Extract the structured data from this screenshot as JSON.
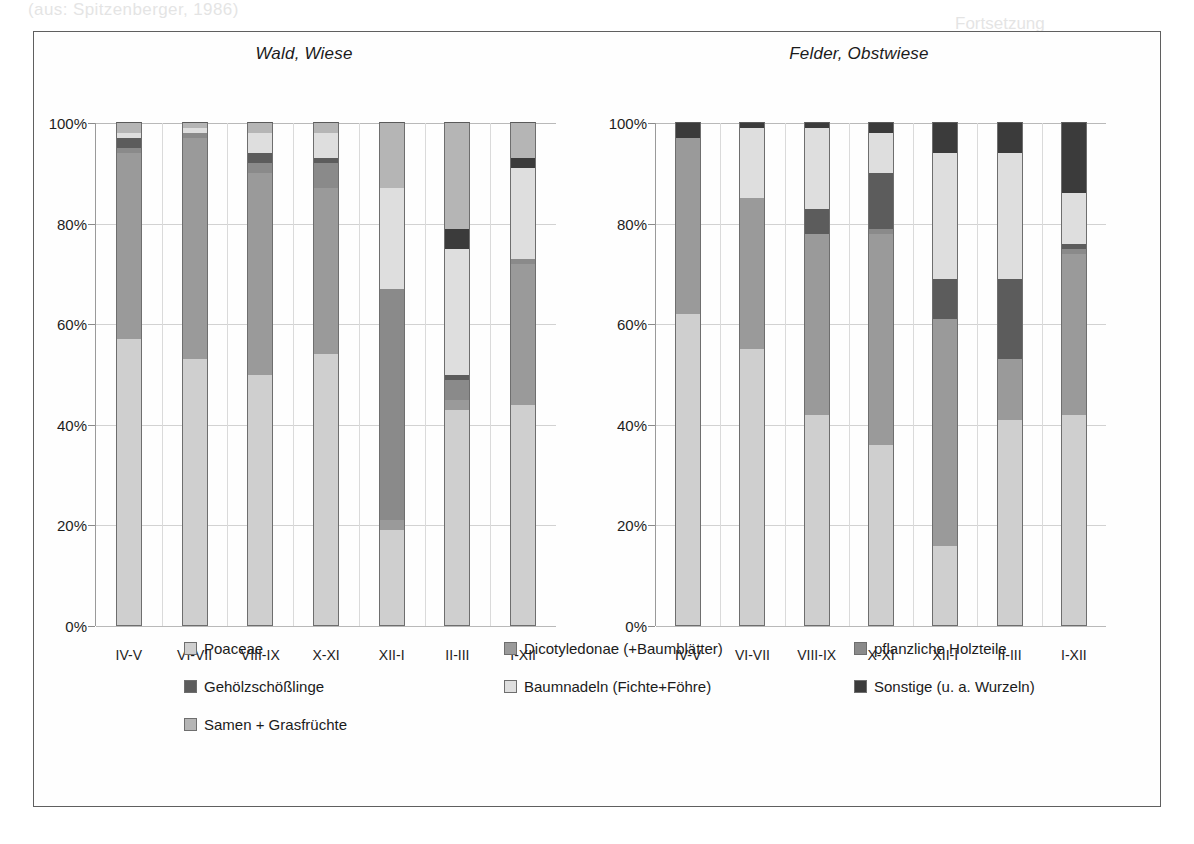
{
  "figure": {
    "panels": [
      {
        "title": "Wald, Wiese"
      },
      {
        "title": "Felder, Obstwiese"
      }
    ],
    "categories": [
      "IV-V",
      "VI-VII",
      "VIII-IX",
      "X-XI",
      "XII-I",
      "II-III",
      "I-XII"
    ],
    "y_ticks": [
      "0%",
      "20%",
      "40%",
      "60%",
      "80%",
      "100%"
    ]
  },
  "legend": {
    "items": [
      {
        "label": "Poaceae",
        "color": "#cfcfcf"
      },
      {
        "label": "Dicotyledonae (+Baumblätter)",
        "color": "#9a9a9a"
      },
      {
        "label": "pflanzliche Holzteile",
        "color": "#8a8a8a"
      },
      {
        "label": "Gehölzschößlinge",
        "color": "#5c5c5c"
      },
      {
        "label": "Baumnadeln (Fichte+Föhre)",
        "color": "#dedede"
      },
      {
        "label": "Sonstige (u. a. Wurzeln)",
        "color": "#3b3b3b"
      },
      {
        "label": "Samen + Grasfrüchte",
        "color": "#b5b5b5"
      }
    ]
  },
  "bleed_text": {
    "line1": "(aus: Spitzenberger, 1986)",
    "line2": "Fortsetzung",
    "line3": "Abb. 12: Zusammensetzung der Nahrung in verschiedenen Lebensräumen",
    "line4": "13"
  },
  "chart_data": [
    {
      "type": "bar",
      "stacked": true,
      "normalized": "100%",
      "title": "Wald, Wiese",
      "xlabel": "",
      "ylabel": "",
      "ylim": [
        0,
        100
      ],
      "grid": true,
      "legend_position": "bottom",
      "categories": [
        "IV-V",
        "VI-VII",
        "VIII-IX",
        "X-XI",
        "XII-I",
        "II-III",
        "I-XII"
      ],
      "series": [
        {
          "name": "Poaceae",
          "color": "#cfcfcf",
          "values": [
            57,
            53,
            50,
            54,
            19,
            43,
            44
          ]
        },
        {
          "name": "Dicotyledonae (+Baumblätter)",
          "color": "#9a9a9a",
          "values": [
            37,
            44,
            40,
            33,
            2,
            2,
            28
          ]
        },
        {
          "name": "pflanzliche Holzteile",
          "color": "#8a8a8a",
          "values": [
            1,
            1,
            2,
            5,
            46,
            4,
            1
          ]
        },
        {
          "name": "Gehölzschößlinge",
          "color": "#5c5c5c",
          "values": [
            2,
            0,
            2,
            1,
            0,
            1,
            0
          ]
        },
        {
          "name": "Baumnadeln (Fichte+Föhre)",
          "color": "#dedede",
          "values": [
            1,
            1,
            4,
            5,
            20,
            25,
            18
          ]
        },
        {
          "name": "Sonstige (u. a. Wurzeln)",
          "color": "#3b3b3b",
          "values": [
            0,
            0,
            0,
            0,
            0,
            4,
            2
          ]
        },
        {
          "name": "Samen + Grasfrüchte",
          "color": "#b5b5b5",
          "values": [
            2,
            1,
            2,
            2,
            13,
            21,
            7
          ]
        }
      ]
    },
    {
      "type": "bar",
      "stacked": true,
      "normalized": "100%",
      "title": "Felder, Obstwiese",
      "xlabel": "",
      "ylabel": "",
      "ylim": [
        0,
        100
      ],
      "grid": true,
      "legend_position": "bottom",
      "categories": [
        "IV-V",
        "VI-VII",
        "VIII-IX",
        "X-XI",
        "XII-I",
        "II-III",
        "I-XII"
      ],
      "series": [
        {
          "name": "Poaceae",
          "color": "#cfcfcf",
          "values": [
            62,
            55,
            42,
            36,
            16,
            41,
            42
          ]
        },
        {
          "name": "Dicotyledonae (+Baumblätter)",
          "color": "#9a9a9a",
          "values": [
            35,
            30,
            36,
            42,
            45,
            12,
            32
          ]
        },
        {
          "name": "pflanzliche Holzteile",
          "color": "#8a8a8a",
          "values": [
            0,
            0,
            0,
            1,
            0,
            0,
            1
          ]
        },
        {
          "name": "Gehölzschößlinge",
          "color": "#5c5c5c",
          "values": [
            0,
            0,
            5,
            11,
            8,
            16,
            1
          ]
        },
        {
          "name": "Baumnadeln (Fichte+Föhre)",
          "color": "#dedede",
          "values": [
            0,
            14,
            16,
            8,
            25,
            25,
            10
          ]
        },
        {
          "name": "Sonstige (u. a. Wurzeln)",
          "color": "#3b3b3b",
          "values": [
            3,
            1,
            1,
            2,
            6,
            6,
            14
          ]
        },
        {
          "name": "Samen + Grasfrüchte",
          "color": "#b5b5b5",
          "values": [
            0,
            0,
            0,
            0,
            0,
            0,
            0
          ]
        }
      ]
    }
  ]
}
